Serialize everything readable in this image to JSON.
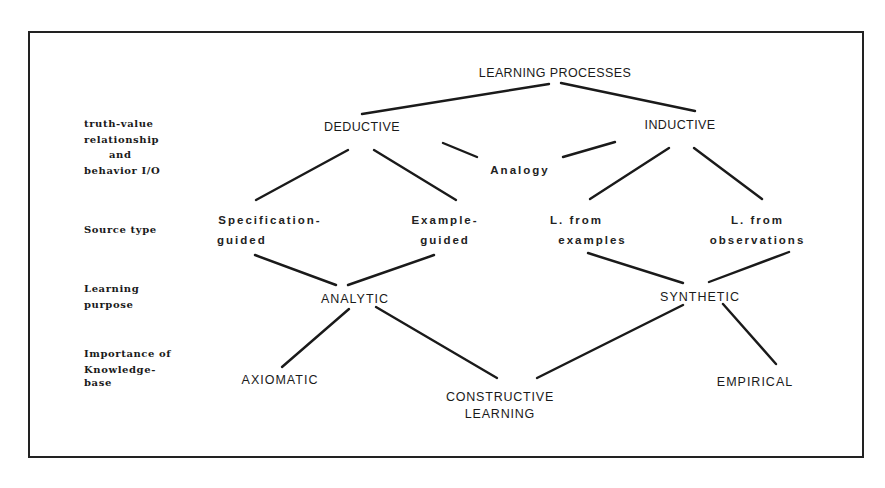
{
  "diagram": {
    "root": "LEARNING PROCESSES",
    "level1": {
      "deductive": "DEDUCTIVE",
      "inductive": "INDUCTIVE",
      "analogy": "Analogy"
    },
    "level2": {
      "spec_line1": "Specification-",
      "spec_line2": "guided",
      "example_line1": "Example-",
      "example_line2": "guided",
      "lex_line1": "L. from",
      "lex_line2": "examples",
      "lobs_line1": "L. from",
      "lobs_line2": "observations"
    },
    "level3": {
      "analytic": "ANALYTIC",
      "synthetic": "SYNTHETIC"
    },
    "level4": {
      "axiomatic": "AXIOMATIC",
      "constructive_line1": "CONSTRUCTIVE",
      "constructive_line2": "LEARNING",
      "empirical": "EMPIRICAL"
    }
  },
  "row_labels": {
    "truth_line1": "truth-value",
    "truth_line2": "relationship",
    "truth_line3": "and",
    "truth_line4": "behavior I/O",
    "source": "Source type",
    "purpose_line1": "Learning",
    "purpose_line2": "purpose",
    "importance_line1": "Importance of",
    "importance_line2": "Knowledge-",
    "importance_line3": "base"
  },
  "edges": [
    {
      "from": "LEARNING PROCESSES",
      "to": "DEDUCTIVE"
    },
    {
      "from": "LEARNING PROCESSES",
      "to": "INDUCTIVE"
    },
    {
      "from": "DEDUCTIVE",
      "to": "Specification-guided"
    },
    {
      "from": "DEDUCTIVE",
      "to": "Example-guided"
    },
    {
      "from": "DEDUCTIVE",
      "to": "Analogy"
    },
    {
      "from": "INDUCTIVE",
      "to": "Analogy"
    },
    {
      "from": "INDUCTIVE",
      "to": "L. from examples"
    },
    {
      "from": "INDUCTIVE",
      "to": "L. from observations"
    },
    {
      "from": "Specification-guided",
      "to": "ANALYTIC"
    },
    {
      "from": "Example-guided",
      "to": "ANALYTIC"
    },
    {
      "from": "L. from examples",
      "to": "SYNTHETIC"
    },
    {
      "from": "L. from observations",
      "to": "SYNTHETIC"
    },
    {
      "from": "ANALYTIC",
      "to": "AXIOMATIC"
    },
    {
      "from": "ANALYTIC",
      "to": "CONSTRUCTIVE LEARNING"
    },
    {
      "from": "SYNTHETIC",
      "to": "CONSTRUCTIVE LEARNING"
    },
    {
      "from": "SYNTHETIC",
      "to": "EMPIRICAL"
    }
  ],
  "colors": {
    "ink": "#1a1a1a",
    "background": "#ffffff"
  }
}
